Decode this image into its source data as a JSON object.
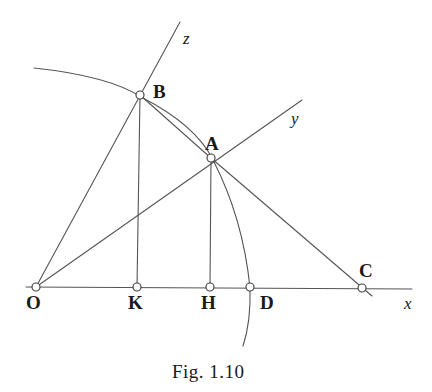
{
  "figure": {
    "caption": "Fig. 1.10",
    "background_color": "#ffffff",
    "stroke_color": "#555555",
    "label_color": "#1a1a1a"
  },
  "points": {
    "O": {
      "label": "O",
      "x": 36,
      "y": 287,
      "label_x": 26,
      "label_y": 293
    },
    "K": {
      "label": "K",
      "x": 137,
      "y": 287,
      "label_x": 128,
      "label_y": 293
    },
    "H": {
      "label": "H",
      "x": 210,
      "y": 287,
      "label_x": 201,
      "label_y": 293
    },
    "D": {
      "label": "D",
      "x": 250,
      "y": 287,
      "label_x": 249,
      "label_y": 293
    },
    "C": {
      "label": "C",
      "x": 362,
      "y": 288,
      "label_x": 359,
      "label_y": 262
    },
    "A": {
      "label": "A",
      "x": 211,
      "y": 158,
      "label_x": 205,
      "label_y": 134
    },
    "B": {
      "label": "B",
      "x": 140,
      "y": 95,
      "label_x": 153,
      "label_y": 82
    }
  },
  "axes": [
    {
      "name": "x",
      "label": "x",
      "label_x": 404,
      "label_y": 295,
      "from_x": 26,
      "from_y": 287,
      "to_x": 412,
      "to_y": 289
    },
    {
      "name": "y",
      "label": "y",
      "label_x": 291,
      "label_y": 110,
      "from_x": 36,
      "from_y": 287,
      "to_x": 302,
      "to_y": 100
    },
    {
      "name": "z",
      "label": "z",
      "label_x": 183,
      "label_y": 30,
      "from_x": 36,
      "from_y": 287,
      "to_x": 180,
      "to_y": 22
    }
  ],
  "segments": [
    {
      "name": "segment-OB-z-axis",
      "x1": 36,
      "y1": 287,
      "x2": 180,
      "y2": 22
    },
    {
      "name": "segment-OA-y-axis",
      "x1": 36,
      "y1": 287,
      "x2": 302,
      "y2": 100
    },
    {
      "name": "segment-x-axis",
      "x1": 26,
      "y1": 287,
      "x2": 412,
      "y2": 289
    },
    {
      "name": "segment-BK-perpendicular",
      "x1": 140,
      "y1": 95,
      "x2": 137,
      "y2": 287
    },
    {
      "name": "segment-AH-perpendicular",
      "x1": 211,
      "y1": 158,
      "x2": 210,
      "y2": 287
    },
    {
      "name": "segment-BA-chord",
      "x1": 140,
      "y1": 95,
      "x2": 212,
      "y2": 159
    },
    {
      "name": "segment-AC",
      "x1": 211,
      "y1": 158,
      "x2": 372,
      "y2": 296
    }
  ],
  "arcs": [
    {
      "name": "arc-through-B",
      "path": "M 34 68 Q 110 76 143 98"
    },
    {
      "name": "arc-through-A-and-D",
      "path": "M 141 97 Q 196 125 213 160 Q 243 218 250 288 Q 251 322 243 346"
    }
  ],
  "markers": {
    "radius": 4,
    "fill": "#ffffff",
    "stroke": "#444444"
  }
}
